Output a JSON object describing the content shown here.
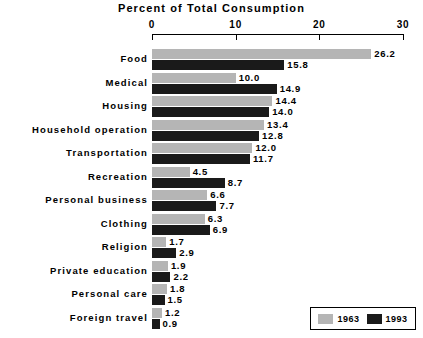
{
  "chart_data": {
    "type": "bar",
    "orientation": "horizontal",
    "title": "Percent of Total Consumption",
    "xlabel": "",
    "ylabel": "",
    "xlim": [
      0,
      30
    ],
    "xticks": [
      0,
      10,
      20,
      30
    ],
    "xtick_labels": [
      "0",
      "10",
      "20",
      "30"
    ],
    "grid": false,
    "legend_position": "bottom-right",
    "categories": [
      "Food",
      "Medical",
      "Housing",
      "Household operation",
      "Transportation",
      "Recreation",
      "Personal business",
      "Clothing",
      "Religion",
      "Private education",
      "Personal care",
      "Foreign travel"
    ],
    "series": [
      {
        "name": "1963",
        "color": "#b5b5b5",
        "values": [
          26.2,
          10.0,
          14.4,
          13.4,
          12.0,
          4.5,
          6.6,
          6.3,
          1.7,
          1.9,
          1.8,
          1.2
        ],
        "labels": [
          "26.2",
          "10.0",
          "14.4",
          "13.4",
          "12.0",
          "4.5",
          "6.6",
          "6.3",
          "1.7",
          "1.9",
          "1.8",
          "1.2"
        ]
      },
      {
        "name": "1993",
        "color": "#1a1a1a",
        "values": [
          15.8,
          14.9,
          14.0,
          12.8,
          11.7,
          8.7,
          7.7,
          6.9,
          2.9,
          2.2,
          1.5,
          0.9
        ],
        "labels": [
          "15.8",
          "14.9",
          "14.0",
          "12.8",
          "11.7",
          "8.7",
          "7.7",
          "6.9",
          "2.9",
          "2.2",
          "1.5",
          "0.9"
        ]
      }
    ]
  },
  "legend": {
    "entries": [
      {
        "label": "1963",
        "color": "#b5b5b5"
      },
      {
        "label": "1993",
        "color": "#1a1a1a"
      }
    ]
  }
}
